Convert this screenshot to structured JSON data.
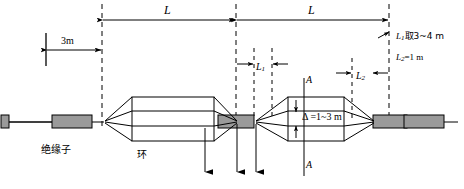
{
  "diagram": {
    "labels": {
      "span_left": "L",
      "span_right": "L",
      "offset_3m": "3m",
      "l1": "L",
      "l1_sub": "1",
      "l2": "L",
      "l2_sub": "2",
      "delta": "Δ =1~3 m",
      "section_top": "A",
      "section_bottom": "A",
      "insulator": "绝缘子",
      "ring": "环",
      "note_l1": "取3~4 m",
      "note_l1_sym": "L",
      "note_l1_sub": "1",
      "note_l2_sym": "L",
      "note_l2_sub": "2",
      "note_l2": "=1 m"
    },
    "colors": {
      "line": "#000000",
      "insulator_fill": "#9a9a9a",
      "insulator_stroke": "#000000",
      "background": "#ffffff",
      "dash": "#000000"
    },
    "values": {
      "offset": "3 m",
      "l1_range": "3~4 m",
      "l2_value": "1 m",
      "delta_range": "1~3 m",
      "subconductor_count": 4
    }
  }
}
